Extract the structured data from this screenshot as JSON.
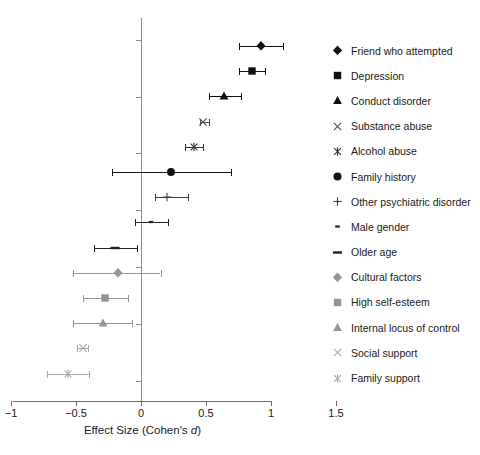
{
  "chart_data": {
    "type": "scatter",
    "title": "",
    "subtitle": "",
    "xlabel": "Effect Size (Cohen's d)",
    "ylabel": "",
    "xlim": [
      -1,
      1.5
    ],
    "xticks": [
      -1,
      -0.5,
      0,
      0.5,
      1,
      1.5
    ],
    "xtick_labels": [
      "−1",
      "−0.5",
      "0",
      "0.5",
      "1",
      "1.5"
    ],
    "grid": false,
    "legend_position": "right",
    "reference_line": 0,
    "series": [
      {
        "name": "Friend who attempted",
        "marker": "diamond",
        "color": "#111111",
        "value": 0.92,
        "ci_low": 0.75,
        "ci_high": 1.09
      },
      {
        "name": "Depression",
        "marker": "square",
        "color": "#111111",
        "value": 0.85,
        "ci_low": 0.75,
        "ci_high": 0.95
      },
      {
        "name": "Conduct disorder",
        "marker": "triangle",
        "color": "#111111",
        "value": 0.64,
        "ci_low": 0.52,
        "ci_high": 0.77
      },
      {
        "name": "Substance abuse",
        "marker": "x",
        "color": "#4d4d4d",
        "value": 0.48,
        "ci_low": 0.45,
        "ci_high": 0.52
      },
      {
        "name": "Alcohol abuse",
        "marker": "asterisk",
        "color": "#333333",
        "value": 0.41,
        "ci_low": 0.34,
        "ci_high": 0.48
      },
      {
        "name": "Family history",
        "marker": "circle",
        "color": "#111111",
        "value": 0.23,
        "ci_low": -0.22,
        "ci_high": 0.69
      },
      {
        "name": "Other psychiatric disorder",
        "marker": "plus",
        "color": "#3d3d3d",
        "value": 0.2,
        "ci_low": 0.11,
        "ci_high": 0.36
      },
      {
        "name": "Male gender",
        "marker": "dash-small",
        "color": "#222222",
        "value": 0.08,
        "ci_low": -0.05,
        "ci_high": 0.21
      },
      {
        "name": "Older age",
        "marker": "dash-large",
        "color": "#222222",
        "value": -0.2,
        "ci_low": -0.36,
        "ci_high": -0.03
      },
      {
        "name": "Cultural factors",
        "marker": "diamond",
        "color": "#949494",
        "value": -0.18,
        "ci_low": -0.52,
        "ci_high": 0.15
      },
      {
        "name": "High self-esteem",
        "marker": "square",
        "color": "#949494",
        "value": -0.28,
        "ci_low": -0.45,
        "ci_high": -0.1
      },
      {
        "name": "Internal locus of control",
        "marker": "triangle",
        "color": "#949494",
        "value": -0.29,
        "ci_low": -0.52,
        "ci_high": -0.07
      },
      {
        "name": "Social support",
        "marker": "x",
        "color": "#a8a8a8",
        "value": -0.45,
        "ci_low": -0.49,
        "ci_high": -0.41
      },
      {
        "name": "Family support",
        "marker": "asterisk",
        "color": "#a8a8a8",
        "value": -0.56,
        "ci_low": -0.72,
        "ci_high": -0.4
      }
    ]
  },
  "axis": {
    "x_title_prefix": "Effect Size (Cohen's ",
    "x_title_italic": "d",
    "x_title_suffix": ")"
  },
  "legend": {
    "items": [
      {
        "label": "Friend who attempted"
      },
      {
        "label": "Depression"
      },
      {
        "label": "Conduct disorder"
      },
      {
        "label": "Substance abuse"
      },
      {
        "label": "Alcohol abuse"
      },
      {
        "label": "Family history"
      },
      {
        "label": "Other psychiatric disorder"
      },
      {
        "label": "Male gender"
      },
      {
        "label": "Older age"
      },
      {
        "label": "Cultural factors"
      },
      {
        "label": "High self-esteem"
      },
      {
        "label": "Internal locus of control"
      },
      {
        "label": "Social support"
      },
      {
        "label": "Family support"
      }
    ]
  },
  "colors": {
    "axis": "#6e6e6e",
    "reference_line": "#8a8a8a",
    "text": "#1a1a1a"
  }
}
